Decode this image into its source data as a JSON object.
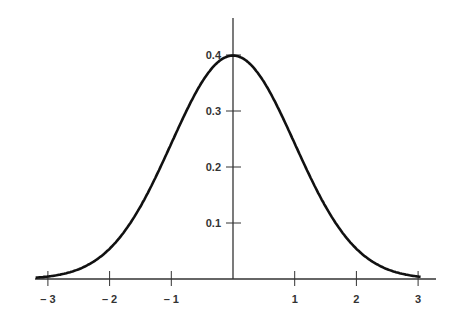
{
  "chart_data": {
    "type": "line",
    "title": "",
    "xlabel": "",
    "ylabel": "",
    "x": [
      -3,
      -2.5,
      -2,
      -1.5,
      -1,
      -0.5,
      0,
      0.5,
      1,
      1.5,
      2,
      2.5,
      3
    ],
    "series": [
      {
        "name": "normal pdf",
        "values": [
          0.0044,
          0.0175,
          0.054,
          0.1295,
          0.242,
          0.3521,
          0.3989,
          0.3521,
          0.242,
          0.1295,
          0.054,
          0.0175,
          0.0044
        ]
      }
    ],
    "xlim": [
      -3.2,
      3.3
    ],
    "ylim": [
      0,
      0.46
    ],
    "x_ticks": [
      "– 3",
      "– 2",
      "– 1",
      "1",
      "2",
      "3"
    ],
    "x_tick_values": [
      -3,
      -2,
      -1,
      1,
      2,
      3
    ],
    "y_ticks": [
      "0.1",
      "0.2",
      "0.3",
      "0.4"
    ],
    "y_tick_values": [
      0.1,
      0.2,
      0.3,
      0.4
    ],
    "grid": false,
    "line_color": "#111111",
    "axis_color": "#333333"
  }
}
